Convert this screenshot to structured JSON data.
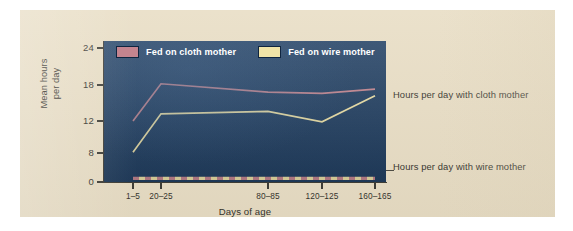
{
  "figure": {
    "background_color": "#e8ddc4",
    "plot_background_color": "#1d3c60"
  },
  "legend": {
    "position": "top-left-inside",
    "entries": [
      {
        "label": "Fed on cloth mother",
        "color": "#c4848f",
        "swatch_name": "legend-swatch-cloth"
      },
      {
        "label": "Fed on wire mother",
        "color": "#f0e4a8",
        "swatch_name": "legend-swatch-wire"
      }
    ]
  },
  "annotations": [
    {
      "name": "annotation-cloth",
      "text": "Hours per day with cloth mother"
    },
    {
      "name": "annotation-wire",
      "text": "Hours per day with wire mother"
    }
  ],
  "chart_data": {
    "type": "line",
    "title": "",
    "xlabel": "Days of age",
    "ylabel": "Mean hours per day",
    "categories": [
      "1-5",
      "20-25",
      "80-85",
      "120-125",
      "160-165"
    ],
    "x_tick_labels": [
      "1–5",
      "20–25",
      "80–85",
      "120–125",
      "160–165"
    ],
    "x_tick_positions_px": [
      113,
      141,
      248,
      302,
      355
    ],
    "y_tick_labels": [
      "0",
      "8",
      "12",
      "18",
      "24"
    ],
    "y_tick_values": [
      0,
      8,
      12,
      18,
      24
    ],
    "y_tick_positions_px": [
      172,
      143,
      111,
      75,
      38
    ],
    "ylim": [
      0,
      26
    ],
    "grid": false,
    "series": [
      {
        "name": "Hours per day with cloth mother",
        "legend_label": "Fed on cloth mother",
        "color": "#c4848f",
        "style": "solid",
        "values": [
          12.0,
          18.2,
          16.8,
          16.6,
          17.3
        ]
      },
      {
        "name": "Hours per day with wire mother",
        "legend_label": "Fed on wire mother",
        "color": "#f0e4a8",
        "style": "solid",
        "values": [
          8.1,
          13.2,
          13.6,
          11.9,
          16.2
        ]
      },
      {
        "name": "Hours per day with wire mother (dashed baseline, cloth-fed)",
        "legend_label": "Fed on cloth mother",
        "color": "#c4848f",
        "style": "dashed",
        "values": [
          1.0,
          1.0,
          1.0,
          1.0,
          1.0
        ]
      },
      {
        "name": "Hours per day with wire mother (dashed baseline, wire-fed)",
        "legend_label": "Fed on wire mother",
        "color": "#f0e4a8",
        "style": "dashed",
        "values": [
          1.0,
          1.0,
          1.0,
          1.0,
          1.0
        ]
      }
    ]
  }
}
